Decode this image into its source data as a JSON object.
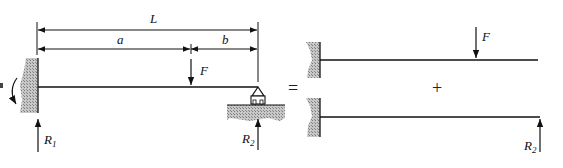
{
  "diagram": {
    "type": "beam-superposition",
    "colors": {
      "line": "#111111",
      "hatch": "#9a9a9a",
      "background": "#ffffff"
    },
    "original_beam": {
      "dimensions": {
        "total": "L",
        "left_segment": "a",
        "right_segment": "b"
      },
      "load": {
        "label": "F"
      },
      "reactions": [
        {
          "label": "R",
          "subscript": "1"
        },
        {
          "label": "R",
          "subscript": "2"
        }
      ],
      "supports": [
        "fixed-wall",
        "pin-roller"
      ]
    },
    "operators": {
      "equals": "=",
      "plus": "+"
    },
    "case_1": {
      "load": {
        "label": "F"
      },
      "support": "fixed-wall"
    },
    "case_2": {
      "load": {
        "label": "R",
        "subscript": "2"
      },
      "support": "fixed-wall"
    }
  }
}
